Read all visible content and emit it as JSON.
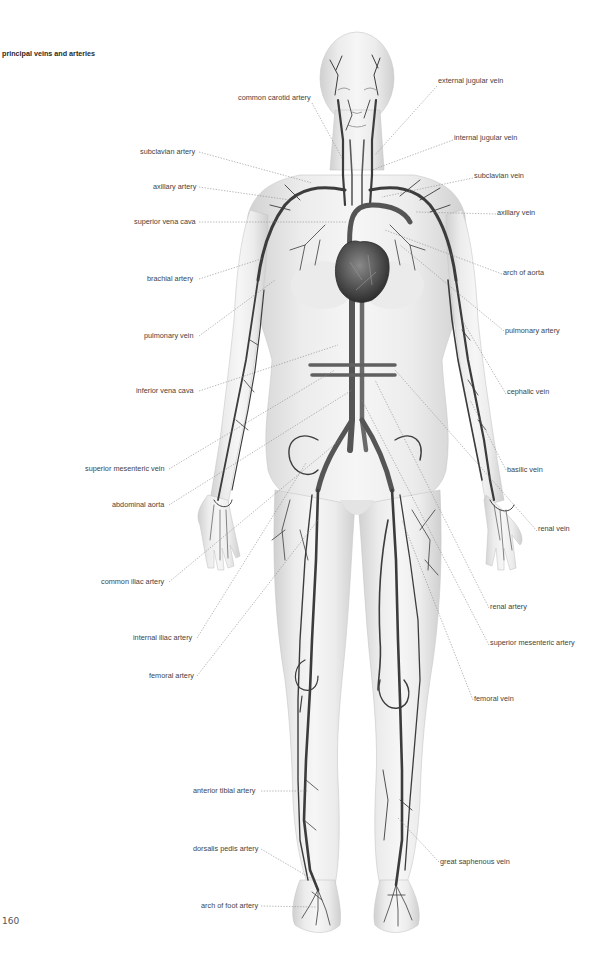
{
  "page": {
    "title": "principal veins and arteries",
    "page_number": "160"
  },
  "colors": {
    "skin_light": "#f2f2f2",
    "skin_shade": "#d4d4d4",
    "vessel_dark": "#3c3c3c",
    "vessel_mid": "#6a6a6a",
    "leader_line": "#8a8a8a",
    "label_text": "#444444"
  },
  "labels_left": [
    {
      "text": "common carotid artery",
      "x": 310,
      "y": 98
    },
    {
      "text": "subclavian artery",
      "x": 198,
      "y": 152
    },
    {
      "text": "axillary artery",
      "x": 198,
      "y": 187
    },
    {
      "text": "superior vena cava",
      "x": 198,
      "y": 222
    },
    {
      "text": "brachial artery",
      "x": 198,
      "y": 279
    },
    {
      "text": "pulmonary vein",
      "x": 198,
      "y": 336
    },
    {
      "text": "inferior vena cava",
      "x": 198,
      "y": 391
    },
    {
      "text": "superior mesenteric vein",
      "x": 168,
      "y": 469
    },
    {
      "text": "abdominal aorta",
      "x": 168,
      "y": 505
    },
    {
      "text": "common iliac artery",
      "x": 168,
      "y": 582
    },
    {
      "text": "internal iliac artery",
      "x": 196,
      "y": 638
    },
    {
      "text": "femoral artery",
      "x": 196,
      "y": 676
    },
    {
      "text": "anterior tibial artery",
      "x": 260,
      "y": 791
    },
    {
      "text": "dorsalis pedis artery",
      "x": 260,
      "y": 849
    },
    {
      "text": "arch of foot artery",
      "x": 260,
      "y": 906
    }
  ],
  "labels_right": [
    {
      "text": "external jugular vein",
      "x": 438,
      "y": 81
    },
    {
      "text": "internal jugular vein",
      "x": 454,
      "y": 138
    },
    {
      "text": "subclavian vein",
      "x": 474,
      "y": 176
    },
    {
      "text": "axillary vein",
      "x": 497,
      "y": 213
    },
    {
      "text": "arch of aorta",
      "x": 503,
      "y": 273
    },
    {
      "text": "pulmonary artery",
      "x": 505,
      "y": 331
    },
    {
      "text": "cephalic vein",
      "x": 507,
      "y": 392
    },
    {
      "text": "basilic vein",
      "x": 507,
      "y": 470
    },
    {
      "text": "renal vein",
      "x": 538,
      "y": 529
    },
    {
      "text": "renal artery",
      "x": 490,
      "y": 607
    },
    {
      "text": "superior mesenteric artery",
      "x": 490,
      "y": 643
    },
    {
      "text": "femoral vein",
      "x": 474,
      "y": 699
    },
    {
      "text": "great saphenous vein",
      "x": 440,
      "y": 862
    }
  ]
}
